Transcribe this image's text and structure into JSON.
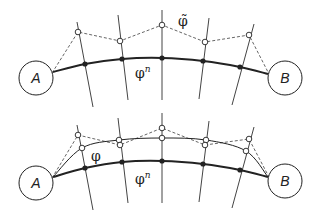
{
  "diagram": {
    "colors": {
      "stroke": "#222222",
      "grid": "#444444",
      "dashed": "#555555",
      "background": "#ffffff"
    },
    "top_panel": {
      "endpoint_a": {
        "label": "A",
        "cx": 36,
        "cy": 78,
        "r": 17
      },
      "endpoint_b": {
        "label": "B",
        "cx": 285,
        "cy": 78,
        "r": 17
      },
      "path_label": "φ",
      "path_label_sup": "n",
      "path_label_pos": [
        135,
        78
      ],
      "perturbed_label": "φ̃",
      "perturbed_label_pos": [
        178,
        26
      ],
      "transversals": [
        {
          "x1": 77,
          "y1": 22,
          "x2": 93,
          "y2": 107
        },
        {
          "x1": 118,
          "y1": 15,
          "x2": 128,
          "y2": 100
        },
        {
          "x1": 162,
          "y1": 10,
          "x2": 162,
          "y2": 100
        },
        {
          "x1": 209,
          "y1": 18,
          "x2": 199,
          "y2": 99
        },
        {
          "x1": 254,
          "y1": 24,
          "x2": 232,
          "y2": 105
        }
      ],
      "path_points": [
        [
          53,
          72
        ],
        [
          85,
          64
        ],
        [
          122,
          59
        ],
        [
          162,
          58
        ],
        [
          203,
          61
        ],
        [
          240,
          67
        ],
        [
          268,
          74
        ]
      ],
      "perturbed_points": [
        [
          78,
          32
        ],
        [
          120,
          41
        ],
        [
          162,
          25
        ],
        [
          205,
          42
        ],
        [
          249,
          35
        ]
      ]
    },
    "bottom_panel": {
      "endpoint_a": {
        "label": "A",
        "cx": 36,
        "cy": 183,
        "r": 17
      },
      "endpoint_b": {
        "label": "B",
        "cx": 285,
        "cy": 181,
        "r": 17
      },
      "path_label": "φ",
      "path_label_sup": "n",
      "path_label_pos": [
        135,
        184
      ],
      "smoothed_label": "φ",
      "smoothed_label_pos": [
        91,
        161
      ],
      "transversals": [
        {
          "x1": 77,
          "y1": 125,
          "x2": 93,
          "y2": 210
        },
        {
          "x1": 118,
          "y1": 118,
          "x2": 128,
          "y2": 203
        },
        {
          "x1": 162,
          "y1": 113,
          "x2": 162,
          "y2": 203
        },
        {
          "x1": 209,
          "y1": 121,
          "x2": 199,
          "y2": 202
        },
        {
          "x1": 254,
          "y1": 127,
          "x2": 232,
          "y2": 208
        }
      ],
      "path_points": [
        [
          53,
          177
        ],
        [
          85,
          168
        ],
        [
          122,
          162
        ],
        [
          162,
          161
        ],
        [
          203,
          164
        ],
        [
          240,
          170
        ],
        [
          268,
          177
        ]
      ],
      "perturbed_points": [
        [
          78,
          135
        ],
        [
          120,
          145
        ],
        [
          162,
          128
        ],
        [
          205,
          145
        ],
        [
          249,
          139
        ]
      ],
      "smoothed_points": [
        [
          53,
          177
        ],
        [
          82,
          148
        ],
        [
          119,
          140
        ],
        [
          162,
          138
        ],
        [
          206,
          140
        ],
        [
          246,
          151
        ],
        [
          268,
          177
        ]
      ]
    }
  }
}
